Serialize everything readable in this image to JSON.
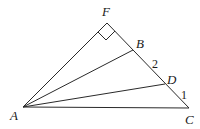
{
  "diagram": {
    "type": "geometry-triangle",
    "points": {
      "A": {
        "label": "A",
        "x": 23,
        "y": 107
      },
      "F": {
        "label": "F",
        "x": 107,
        "y": 23
      },
      "B": {
        "label": "B",
        "x": 133,
        "y": 50
      },
      "D": {
        "label": "D",
        "x": 165,
        "y": 84
      },
      "C": {
        "label": "C",
        "x": 189,
        "y": 108
      }
    },
    "segments": [
      "AF",
      "FC",
      "AC",
      "AB",
      "AD"
    ],
    "right_angle_at": "F",
    "segment_labels": {
      "BD": "2",
      "DC": "1"
    }
  }
}
